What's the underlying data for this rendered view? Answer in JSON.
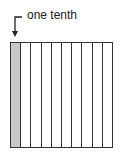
{
  "label": "one tenth",
  "diagram": {
    "total_parts": 10,
    "shaded_parts": 1,
    "shade_color": "#c8c8c8",
    "line_color": "#333333"
  }
}
